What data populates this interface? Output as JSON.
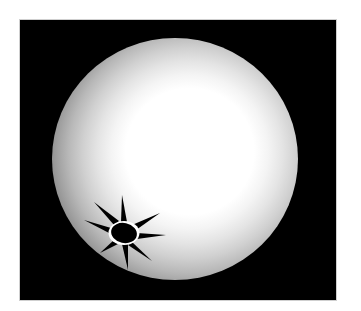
{
  "figure": {
    "background_color": "#000000",
    "page_color": "#ffffff",
    "sphere": {
      "shape": "sphere",
      "highlight_color": "#ffffff",
      "edge_color": "#8a8a8a",
      "shading": "stepped radial gradient, brightest toward upper right"
    },
    "light_source": {
      "icon": "sun-icon",
      "color": "#000000",
      "ray_count": 8,
      "position": "lower-left on sphere surface"
    }
  }
}
